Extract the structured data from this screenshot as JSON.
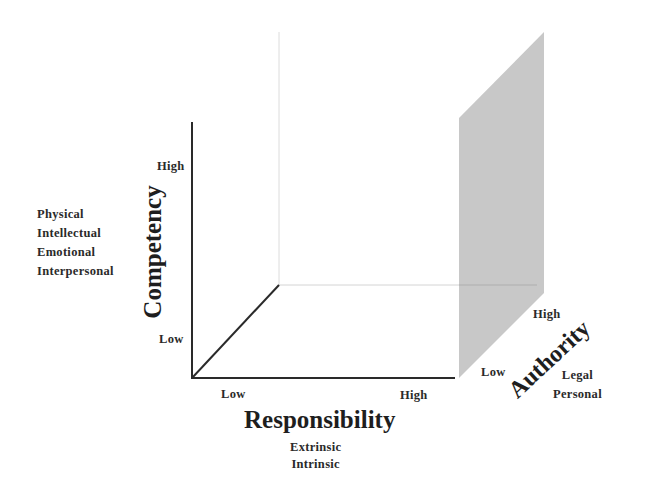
{
  "diagram": {
    "type": "3d-axes-concept",
    "axes": {
      "competency": {
        "title": "Competency",
        "low_label": "Low",
        "high_label": "High",
        "dimensions": [
          "Physical",
          "Intellectual",
          "Emotional",
          "Interpersonal"
        ]
      },
      "responsibility": {
        "title": "Responsibility",
        "low_label": "Low",
        "high_label": "High",
        "dimensions": [
          "Extrinsic",
          "Intrinsic"
        ]
      },
      "authority": {
        "title": "Authority",
        "low_label": "Low",
        "high_label": "High",
        "dimensions": [
          "Legal",
          "Personal"
        ]
      }
    },
    "colors": {
      "axis": "#2a2a2a",
      "guide": "#d8d8d8",
      "plane_fill": "#c8c8c8",
      "background": "#ffffff"
    }
  }
}
